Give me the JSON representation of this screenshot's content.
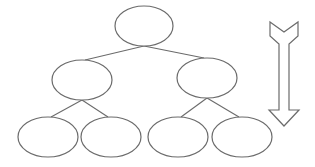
{
  "diagram": {
    "type": "tree-hierarchy",
    "stroke_color": "#6b6b6b",
    "background": "#ffffff",
    "levels": 3,
    "nodes": [
      {
        "id": "root",
        "level": 0,
        "cx": 144,
        "cy": 26,
        "rx": 29,
        "ry": 20,
        "label": ""
      },
      {
        "id": "mid-left",
        "level": 1,
        "cx": 82,
        "cy": 80,
        "rx": 30,
        "ry": 20,
        "label": ""
      },
      {
        "id": "mid-right",
        "level": 1,
        "cx": 207,
        "cy": 78,
        "rx": 30,
        "ry": 20,
        "label": ""
      },
      {
        "id": "leaf-1",
        "level": 2,
        "cx": 48,
        "cy": 137,
        "rx": 30,
        "ry": 20,
        "label": ""
      },
      {
        "id": "leaf-2",
        "level": 2,
        "cx": 111,
        "cy": 137,
        "rx": 30,
        "ry": 20,
        "label": ""
      },
      {
        "id": "leaf-3",
        "level": 2,
        "cx": 178,
        "cy": 137,
        "rx": 30,
        "ry": 20,
        "label": ""
      },
      {
        "id": "leaf-4",
        "level": 2,
        "cx": 242,
        "cy": 137,
        "rx": 30,
        "ry": 20,
        "label": ""
      }
    ],
    "edges": [
      {
        "from": "root",
        "to": "mid-left"
      },
      {
        "from": "root",
        "to": "mid-right"
      },
      {
        "from": "mid-left",
        "to": "leaf-1"
      },
      {
        "from": "mid-left",
        "to": "leaf-2"
      },
      {
        "from": "mid-right",
        "to": "leaf-3"
      },
      {
        "from": "mid-right",
        "to": "leaf-4"
      }
    ],
    "arrow": {
      "direction": "down",
      "icon": "down-arrow-icon",
      "style": "outlined-block-arrow-with-notched-tail"
    }
  }
}
